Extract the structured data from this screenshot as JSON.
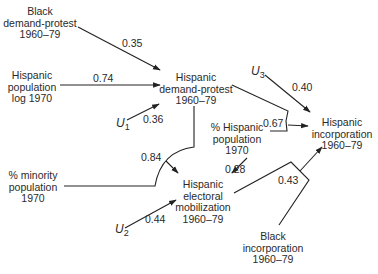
{
  "nodes": {
    "black_demand_protest": [
      "Black",
      "demand-protest",
      "1960–79"
    ],
    "hispanic_population_log": [
      "Hispanic",
      "population",
      "log 1970"
    ],
    "hispanic_demand_protest": [
      "Hispanic",
      "demand-protest",
      "1960–79"
    ],
    "pct_minority_population": [
      "% minority",
      "population",
      "1970"
    ],
    "pct_hispanic_population": [
      "% Hispanic",
      "population",
      "1970"
    ],
    "hispanic_electoral_mobilization": [
      "Hispanic",
      "electoral",
      "mobilization",
      "1960–79"
    ],
    "hispanic_incorporation": [
      "Hispanic",
      "incorporation",
      "1960–79"
    ],
    "black_incorporation": [
      "Black",
      "incorporation",
      "1960–79"
    ]
  },
  "error_terms": {
    "u1": {
      "symbol": "U",
      "sub": "1"
    },
    "u2": {
      "symbol": "U",
      "sub": "2"
    },
    "u3": {
      "symbol": "U",
      "sub": "3"
    }
  },
  "paths": [
    {
      "from": "Black demand-protest 1960–79",
      "to": "Hispanic demand-protest 1960–79",
      "coef": "0.35"
    },
    {
      "from": "Hispanic population log 1970",
      "to": "Hispanic demand-protest 1960–79",
      "coef": "0.74"
    },
    {
      "from": "U1",
      "to": "Hispanic demand-protest 1960–79",
      "coef": "0.36"
    },
    {
      "from": "Hispanic demand-protest 1960–79 + % minority population 1970",
      "to": "Hispanic electoral mobilization 1960–79",
      "coef": "0.84"
    },
    {
      "from": "% Hispanic population 1970",
      "to": "Hispanic electoral mobilization 1960–79",
      "coef": "0.28"
    },
    {
      "from": "U2",
      "to": "Hispanic electoral mobilization 1960–79",
      "coef": "0.44"
    },
    {
      "from": "Hispanic demand-protest 1960–79 + % Hispanic population 1970",
      "to": "Hispanic incorporation 1960–79",
      "coef": "0.67"
    },
    {
      "from": "U3",
      "to": "Hispanic incorporation 1960–79",
      "coef": "0.40"
    },
    {
      "from": "Hispanic electoral mobilization 1960–79 + Black incorporation 1960–79",
      "to": "Hispanic incorporation 1960–79",
      "coef": "0.43"
    }
  ]
}
